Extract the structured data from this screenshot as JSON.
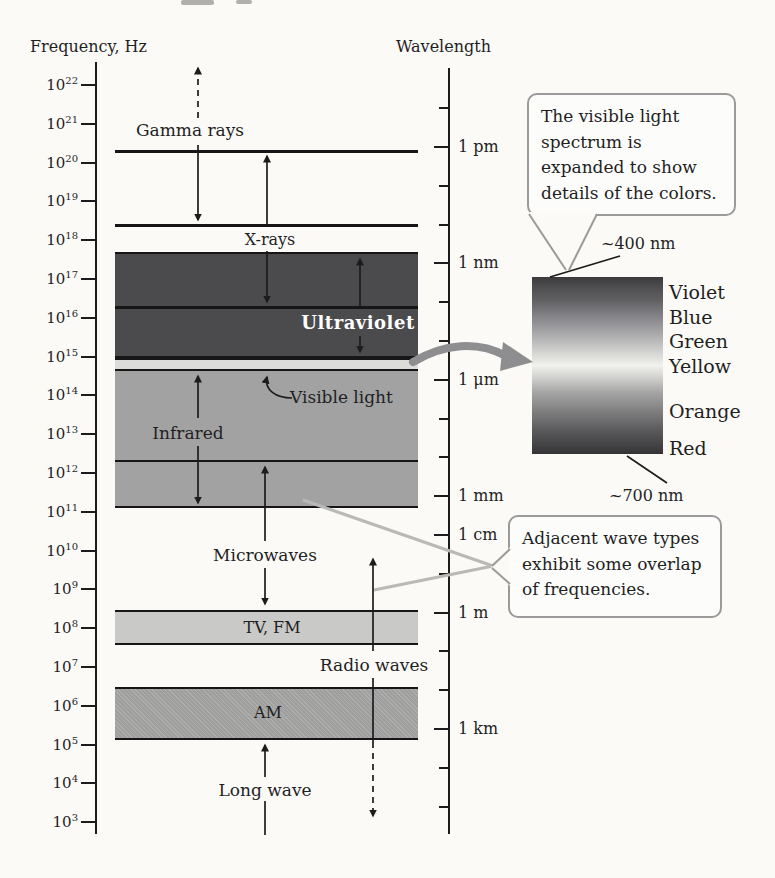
{
  "axes": {
    "frequency": {
      "title": "Frequency, Hz",
      "base": "10",
      "exponents": [
        22,
        21,
        20,
        19,
        18,
        17,
        16,
        15,
        14,
        13,
        12,
        11,
        10,
        9,
        8,
        7,
        6,
        5,
        4,
        3
      ]
    },
    "wavelength": {
      "title": "Wavelength",
      "tick_labels": [
        "1 pm",
        "1 nm",
        "1 μm",
        "1 mm",
        "1 cm",
        "1 m",
        "1 km"
      ]
    }
  },
  "bands": {
    "gamma": {
      "label": "Gamma rays"
    },
    "xray": {
      "label": "X-rays"
    },
    "uv": {
      "label": "Ultraviolet"
    },
    "visible": {
      "label": "Visible light"
    },
    "ir": {
      "label": "Infrared"
    },
    "micro": {
      "label": "Microwaves"
    },
    "tvfm": {
      "label": "TV, FM"
    },
    "radio": {
      "label": "Radio waves"
    },
    "am": {
      "label": "AM"
    },
    "long": {
      "label": "Long wave"
    }
  },
  "callouts": {
    "visible_spectrum": {
      "lines": [
        "The visible light",
        "spectrum is",
        "expanded to show",
        "details of the colors."
      ]
    },
    "overlap": {
      "lines": [
        "Adjacent wave types",
        "exhibit some overlap",
        "of frequencies."
      ]
    }
  },
  "spectrum_inset": {
    "top_wavelength": "~400 nm",
    "bottom_wavelength": "~700 nm",
    "color_names": [
      "Violet",
      "Blue",
      "Green",
      "Yellow",
      "Orange",
      "Red"
    ]
  },
  "palette": {
    "paper": "#fbfaf7",
    "ink": "#1c1c1c",
    "uv_band": "#4b4b4d",
    "visible_strip": "#dcdcda",
    "ir_band": "#a2a2a3",
    "tvfm_band": "#c9c9c8",
    "am_band": "#a7a7a6",
    "callout_border": "#9a9a9a",
    "pointer_gray": "#b9b9b7",
    "big_arrow_gray": "#8e8e90",
    "spectrum_gradient_stops": [
      [
        0,
        "#3a3a3c"
      ],
      [
        5,
        "#4c4c4e"
      ],
      [
        13,
        "#606063"
      ],
      [
        23,
        "#87878b"
      ],
      [
        33,
        "#adadaf"
      ],
      [
        43,
        "#d5d5d3"
      ],
      [
        50,
        "#f1f1ed"
      ],
      [
        57,
        "#d0d0ce"
      ],
      [
        65,
        "#a6a6a6"
      ],
      [
        75,
        "#828283"
      ],
      [
        87,
        "#59595b"
      ],
      [
        97,
        "#3d3d3f"
      ],
      [
        100,
        "#333335"
      ]
    ]
  },
  "chart_data": {
    "type": "diagram",
    "bands_log10_hz": [
      {
        "label": "Gamma rays",
        "range": [
          18.4,
          22.6
        ]
      },
      {
        "label": "X-rays",
        "range": [
          16.25,
          20.3
        ]
      },
      {
        "label": "Ultraviolet",
        "range": [
          15.0,
          17.7
        ]
      },
      {
        "label": "Visible light",
        "range": [
          14.6,
          14.95
        ]
      },
      {
        "label": "Infrared",
        "range": [
          11.1,
          14.6
        ]
      },
      {
        "label": "Microwaves",
        "range": [
          8.5,
          12.3
        ]
      },
      {
        "label": "TV, FM",
        "range": [
          7.6,
          8.5
        ]
      },
      {
        "label": "Radio waves",
        "range": [
          2.8,
          9.4
        ]
      },
      {
        "label": "AM",
        "range": [
          5.1,
          6.5
        ]
      },
      {
        "label": "Long wave",
        "range": [
          2.8,
          5.1
        ]
      }
    ],
    "visible_spectrum_nm": {
      "violet": 400,
      "red": 700
    }
  }
}
